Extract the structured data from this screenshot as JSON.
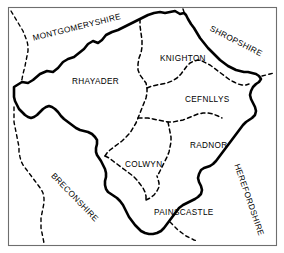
{
  "map": {
    "title": "Radnorshire Hundreds",
    "subject": "Radnorshire",
    "background_color": "#ffffff",
    "frame_color": "#6e6e6e",
    "outline_color": "#000000",
    "divider_color": "#000000",
    "hundreds": [
      {
        "name": "RHAYADER",
        "x": 72,
        "y": 78,
        "rotation": 0
      },
      {
        "name": "KNIGHTON",
        "x": 160,
        "y": 55,
        "rotation": 0
      },
      {
        "name": "CEFNLLYS",
        "x": 185,
        "y": 96,
        "rotation": 0
      },
      {
        "name": "RADNOR",
        "x": 190,
        "y": 142,
        "rotation": 0
      },
      {
        "name": "COLWYN",
        "x": 125,
        "y": 161,
        "rotation": 0
      },
      {
        "name": "PAINSCASTLE",
        "x": 154,
        "y": 209,
        "rotation": 0
      }
    ],
    "neighbours": [
      {
        "name": "MONTGOMERYSHIRE",
        "x": 32,
        "y": 35,
        "rotation": -14
      },
      {
        "name": "SHROPSHIRE",
        "x": 212,
        "y": 25,
        "rotation": 27
      },
      {
        "name": "BRECONSHIRE",
        "x": 55,
        "y": 172,
        "rotation": 46
      },
      {
        "name": "HEREFORDSHIRE",
        "x": 240,
        "y": 163,
        "rotation": 71
      }
    ]
  }
}
